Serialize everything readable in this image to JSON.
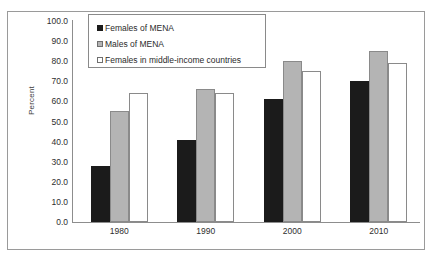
{
  "chart_data": {
    "type": "bar",
    "title": "",
    "xlabel": "",
    "ylabel": "Percent",
    "ylim": [
      0,
      100
    ],
    "ytick_labels": [
      "100.0",
      "90.0",
      "80.0",
      "70.0",
      "60.0",
      "50.0",
      "40.0",
      "30.0",
      "20.0",
      "10.0",
      "0.0"
    ],
    "ytick_values": [
      100,
      90,
      80,
      70,
      60,
      50,
      40,
      30,
      20,
      10,
      0
    ],
    "grid": false,
    "legend_position": "top-left-inside",
    "categories": [
      "1980",
      "1990",
      "2000",
      "2010"
    ],
    "series": [
      {
        "name": "Females of MENA",
        "color": "#1b1b1b",
        "values": [
          28.0,
          41.0,
          61.0,
          70.0
        ]
      },
      {
        "name": "Males of MENA",
        "color": "#b4b4b4",
        "values": [
          55.0,
          66.0,
          80.0,
          85.0
        ]
      },
      {
        "name": "Females in middle-income countries",
        "color": "#ffffff",
        "values": [
          64.0,
          64.0,
          75.0,
          79.0
        ]
      }
    ]
  },
  "axis_colors": {
    "axis_line": "#8d8d8d",
    "frame": "#9a9a9a",
    "text": "#2e2e2e"
  }
}
